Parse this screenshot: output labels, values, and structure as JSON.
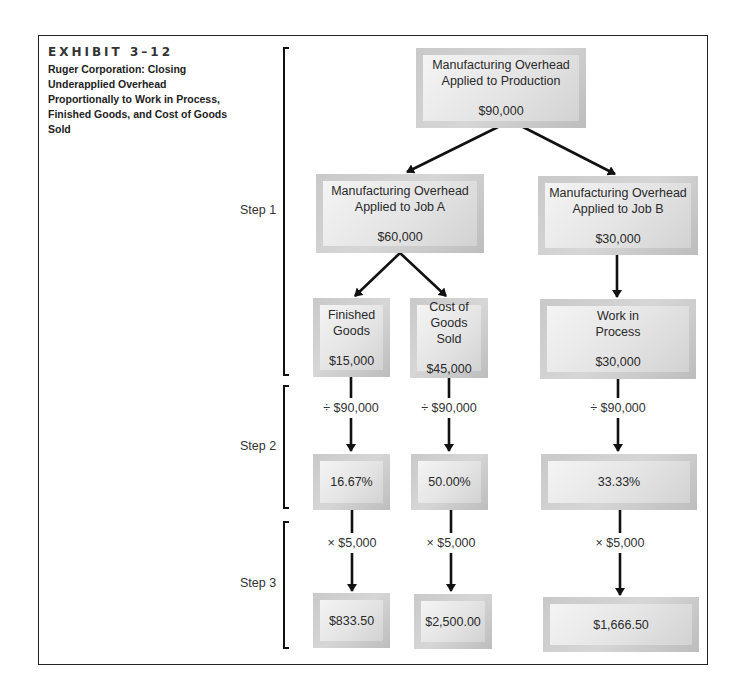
{
  "exhibit": {
    "number": "EXHIBIT 3–12",
    "title": "Ruger Corporation: Closing Underapplied Overhead Proportionally to Work in Process, Finished Goods, and Cost of Goods Sold"
  },
  "steps": [
    "Step 1",
    "Step 2",
    "Step 3"
  ],
  "nodes": {
    "top": {
      "label": "Manufacturing Overhead Applied to Production",
      "amount": "$90,000"
    },
    "job_a": {
      "label": "Manufacturing Overhead Applied to Job A",
      "amount": "$60,000"
    },
    "job_b": {
      "label": "Manufacturing Overhead Applied to Job B",
      "amount": "$30,000"
    },
    "finished_goods": {
      "label": "Finished Goods",
      "amount": "$15,000"
    },
    "cogs": {
      "label": "Cost of Goods Sold",
      "amount": "$45,000"
    },
    "wip": {
      "label": "Work in Process",
      "amount": "$30,000"
    }
  },
  "divide_label": "÷ $90,000",
  "multiply_label": "× $5,000",
  "percentages": {
    "finished_goods": "16.67%",
    "cogs": "50.00%",
    "wip": "33.33%"
  },
  "allocations": {
    "finished_goods": "$833.50",
    "cogs": "$2,500.00",
    "wip": "$1,666.50"
  }
}
